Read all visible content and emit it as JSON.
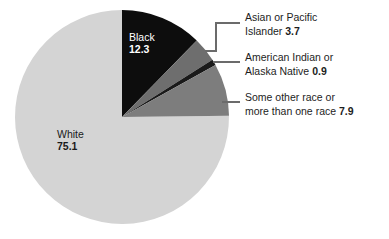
{
  "chart_data": {
    "type": "pie",
    "title": "",
    "subtitle": "",
    "xlabel": "",
    "ylabel": "",
    "units": "percent",
    "legend_position": "callouts-right",
    "grid": false,
    "start_angle_deg": 0,
    "direction": "clockwise",
    "categories": [
      "Black",
      "Asian or Pacific Islander",
      "American Indian or Alaska Native",
      "Some other race or more than one race",
      "White"
    ],
    "values": [
      12.3,
      3.7,
      0.9,
      7.9,
      75.1
    ],
    "slices": [
      {
        "name": "Black",
        "value": 12.3,
        "value_text": "12.3",
        "color": "#0d0d0d",
        "label_placement": "inside",
        "label_color": "#ffffff"
      },
      {
        "name": "Asian or Pacific Islander",
        "value": 3.7,
        "value_text": "3.7",
        "color": "#6e6e6e",
        "label_placement": "callout",
        "label_color": "#1d1d1d"
      },
      {
        "name": "American Indian or Alaska Native",
        "value": 0.9,
        "value_text": "0.9",
        "color": "#1a1a1a",
        "label_placement": "callout",
        "label_color": "#1d1d1d"
      },
      {
        "name": "Some other race or more than one race",
        "value": 7.9,
        "value_text": "7.9",
        "color": "#7d7d7d",
        "label_placement": "callout",
        "label_color": "#1d1d1d"
      },
      {
        "name": "White",
        "value": 75.1,
        "value_text": "75.1",
        "color": "#d4d4d4",
        "label_placement": "inside",
        "label_color": "#1a1a1a"
      }
    ]
  },
  "inside_labels": {
    "black": {
      "name": "Black",
      "value": "12.3"
    },
    "white": {
      "name": "White",
      "value": "75.1"
    }
  },
  "callouts": {
    "asian": {
      "line1": "Asian or Pacific",
      "line2_text": "Islander",
      "line2_value": "3.7"
    },
    "american_indian": {
      "line1": "American Indian or",
      "line2_text": "Alaska Native",
      "line2_value": "0.9"
    },
    "other_race": {
      "line1": "Some other race or",
      "line2_text": "more than one race",
      "line2_value": "7.9"
    }
  },
  "colors": {
    "background": "#ffffff",
    "slice_black": "#0d0d0d",
    "slice_asian": "#6e6e6e",
    "slice_american_indian": "#1a1a1a",
    "slice_other": "#7d7d7d",
    "slice_white": "#d4d4d4",
    "leader_line": "#6b6b6b",
    "text": "#1d1d1d"
  }
}
